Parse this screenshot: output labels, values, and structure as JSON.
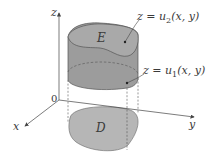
{
  "figure": {
    "type": "3d-solid-region-diagram",
    "axes": {
      "x_label": "x",
      "y_label": "y",
      "z_label": "z",
      "origin_label": "0"
    },
    "solid_label": "E",
    "projection_label": "D",
    "upper_surface": {
      "lhs": "z = u",
      "subscript": "2",
      "args": "(x, y)"
    },
    "lower_surface": {
      "lhs": "z = u",
      "subscript": "1",
      "args": "(x, y)"
    },
    "colors": {
      "solid_fill": "#9a9a9a",
      "top_fill": "#a8a8a8",
      "region_fill": "#b4b4b4",
      "lines": "#555555",
      "background": "#ffffff"
    }
  }
}
